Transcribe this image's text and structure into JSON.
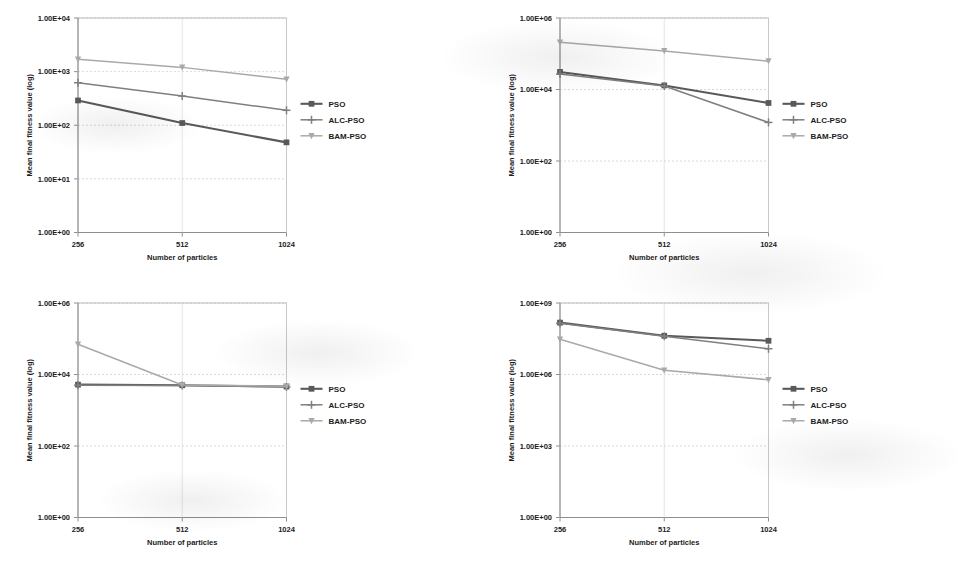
{
  "figure": {
    "panel_count": 4,
    "shared": {
      "xlabel": "Number of particles",
      "ylabel": "Mean final fitness value (log)",
      "xticks": [
        "256",
        "512",
        "1024"
      ],
      "x_values": [
        256,
        512,
        1024
      ],
      "legend_entries": [
        {
          "label": "PSO",
          "color": "#595959",
          "marker": "square"
        },
        {
          "label": "ALC-PSO",
          "color": "#7f7f7f",
          "marker": "plus"
        },
        {
          "label": "BAM-PSO",
          "color": "#a9a9a9",
          "marker": "triangle-down"
        }
      ]
    }
  },
  "chart_data": [
    {
      "id": "panel-top-left",
      "type": "line",
      "title": "",
      "xlabel": "Number of particles",
      "ylabel": "Mean final fitness value (log)",
      "categories": [
        "256",
        "512",
        "1024"
      ],
      "x": [
        256,
        512,
        1024
      ],
      "yscale": "log",
      "ylim": [
        1,
        10000
      ],
      "yticks": [
        "1.00E+00",
        "1.00E+01",
        "1.00E+02",
        "1.00E+03",
        "1.00E+04"
      ],
      "ytick_values": [
        1,
        10,
        100,
        1000,
        10000
      ],
      "grid": true,
      "legend_position": "right",
      "series": [
        {
          "name": "PSO",
          "color": "#595959",
          "marker": "square",
          "values": [
            290,
            110,
            48
          ]
        },
        {
          "name": "ALC-PSO",
          "color": "#7f7f7f",
          "marker": "plus",
          "values": [
            620,
            350,
            190
          ]
        },
        {
          "name": "BAM-PSO",
          "color": "#a9a9a9",
          "marker": "triangle-down",
          "values": [
            1700,
            1200,
            720
          ]
        }
      ]
    },
    {
      "id": "panel-top-right",
      "type": "line",
      "title": "",
      "xlabel": "Number of particles",
      "ylabel": "Mean final fitness value (log)",
      "categories": [
        "256",
        "512",
        "1024"
      ],
      "x": [
        256,
        512,
        1024
      ],
      "yscale": "log",
      "ylim": [
        1,
        1000000
      ],
      "yticks": [
        "1.00E+00",
        "1.00E+02",
        "1.00E+04",
        "1.00E+06"
      ],
      "ytick_values": [
        1,
        100,
        10000,
        1000000
      ],
      "grid": true,
      "legend_position": "right",
      "series": [
        {
          "name": "PSO",
          "color": "#595959",
          "marker": "square",
          "values": [
            31000,
            13000,
            4200
          ]
        },
        {
          "name": "ALC-PSO",
          "color": "#7f7f7f",
          "marker": "plus",
          "values": [
            27000,
            12500,
            1200
          ]
        },
        {
          "name": "BAM-PSO",
          "color": "#a9a9a9",
          "marker": "triangle-down",
          "values": [
            210000,
            120000,
            62000
          ]
        }
      ]
    },
    {
      "id": "panel-bottom-left",
      "type": "line",
      "title": "",
      "xlabel": "Number of particles",
      "ylabel": "Mean final fitness value (log)",
      "categories": [
        "256",
        "512",
        "1024"
      ],
      "x": [
        256,
        512,
        1024
      ],
      "yscale": "log",
      "ylim": [
        1,
        1000000
      ],
      "yticks": [
        "1.00E+00",
        "1.00E+02",
        "1.00E+04",
        "1.00E+06"
      ],
      "ytick_values": [
        1,
        100,
        10000,
        1000000
      ],
      "grid": true,
      "legend_position": "right",
      "series": [
        {
          "name": "PSO",
          "color": "#595959",
          "marker": "square",
          "values": [
            5200,
            5000,
            4600
          ]
        },
        {
          "name": "ALC-PSO",
          "color": "#7f7f7f",
          "marker": "plus",
          "values": [
            5000,
            4900,
            4500
          ]
        },
        {
          "name": "BAM-PSO",
          "color": "#a9a9a9",
          "marker": "triangle-down",
          "values": [
            70000,
            5100,
            4700
          ]
        }
      ]
    },
    {
      "id": "panel-bottom-right",
      "type": "line",
      "title": "",
      "xlabel": "Number of particles",
      "ylabel": "Mean final fitness value (log)",
      "categories": [
        "256",
        "512",
        "1024"
      ],
      "x": [
        256,
        512,
        1024
      ],
      "yscale": "log",
      "ylim": [
        1,
        1000000000
      ],
      "yticks": [
        "1.00E+00",
        "1.00E+03",
        "1.00E+06",
        "1.00E+09"
      ],
      "ytick_values": [
        1,
        1000,
        1000000,
        1000000000
      ],
      "grid": true,
      "legend_position": "right",
      "series": [
        {
          "name": "PSO",
          "color": "#595959",
          "marker": "square",
          "values": [
            150000000,
            42000000,
            26000000
          ]
        },
        {
          "name": "ALC-PSO",
          "color": "#7f7f7f",
          "marker": "plus",
          "values": [
            140000000,
            40000000,
            12000000
          ]
        },
        {
          "name": "BAM-PSO",
          "color": "#a9a9a9",
          "marker": "triangle-down",
          "values": [
            30000000,
            1500000,
            600000
          ]
        }
      ]
    }
  ]
}
